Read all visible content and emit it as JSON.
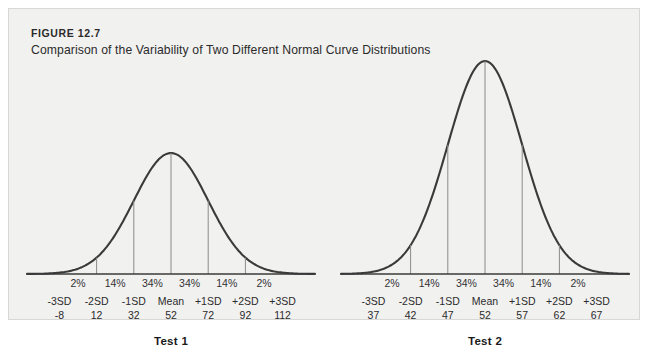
{
  "figure": {
    "number": "FIGURE 12.7",
    "title": "Comparison of the Variability of Two Different Normal Curve Distributions"
  },
  "style": {
    "panel_bg": "#f1f1f0",
    "page_bg": "#ffffff",
    "curve_color": "#3a3a3a",
    "rule_color": "#8a8a8a",
    "text_color": "#2b2b2b"
  },
  "chart_data": [
    {
      "type": "line",
      "name": "Test 1",
      "title": "Test 1",
      "distribution": "normal",
      "mean": 52,
      "sd": 20,
      "peak_height_px": 121,
      "xlabel": "",
      "ylabel": "",
      "grid": false,
      "legend": "none",
      "sd_labels": [
        "-3SD",
        "-2SD",
        "-1SD",
        "Mean",
        "+1SD",
        "+2SD",
        "+3SD"
      ],
      "score_values": [
        "-8",
        "12",
        "32",
        "52",
        "72",
        "92",
        "112"
      ],
      "band_percents": [
        "2%",
        "14%",
        "34%",
        "34%",
        "14%",
        "2%"
      ]
    },
    {
      "type": "line",
      "name": "Test 2",
      "title": "Test 2",
      "distribution": "normal",
      "mean": 52,
      "sd": 5,
      "peak_height_px": 213,
      "xlabel": "",
      "ylabel": "",
      "grid": false,
      "legend": "none",
      "sd_labels": [
        "-3SD",
        "-2SD",
        "-1SD",
        "Mean",
        "+1SD",
        "+2SD",
        "+3SD"
      ],
      "score_values": [
        "37",
        "42",
        "47",
        "52",
        "57",
        "62",
        "67"
      ],
      "band_percents": [
        "2%",
        "14%",
        "34%",
        "34%",
        "14%",
        "2%"
      ]
    }
  ]
}
